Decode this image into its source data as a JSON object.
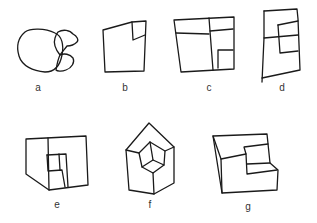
{
  "figures": [
    {
      "id": "a",
      "label": "a",
      "description": "scribbled overlapping loops"
    },
    {
      "id": "b",
      "label": "b",
      "description": "square with small square in top-right corner"
    },
    {
      "id": "c",
      "label": "c",
      "description": "square subdivided into rectangles"
    },
    {
      "id": "d",
      "label": "d",
      "description": "tall rectangle with inner subdivided shapes"
    },
    {
      "id": "e",
      "label": "e",
      "description": "box with inner recessed step, partial 3D"
    },
    {
      "id": "f",
      "label": "f",
      "description": "pentagon house shape with inner cube"
    },
    {
      "id": "g",
      "label": "g",
      "description": "3D L-shaped step block"
    }
  ],
  "colors": {
    "stroke": "#1a1a1a",
    "background": "#ffffff",
    "label": "#333333"
  }
}
